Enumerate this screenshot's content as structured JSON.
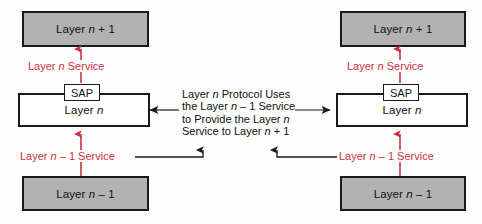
{
  "diagram": {
    "colors": {
      "box_fill_shaded": "#b2b2b2",
      "box_fill_hollow": "#ffffff",
      "box_border": "#1a1a1a",
      "service_label": "#c9333f",
      "protocol_line": "#1a1a1a",
      "background": "#fdfdfd"
    },
    "left_stack": {
      "upper_layer_box": "Layer n + 1",
      "middle_layer_box": "Layer n",
      "lower_layer_box": "Layer n – 1",
      "sap_box": "SAP",
      "upper_service_label": "Layer n Service",
      "lower_service_label": "Layer n – 1 Service"
    },
    "right_stack": {
      "upper_layer_box": "Layer n + 1",
      "middle_layer_box": "Layer n",
      "lower_layer_box": "Layer n – 1",
      "sap_box": "SAP",
      "upper_service_label": "Layer n Service",
      "lower_service_label": "Layer n – 1 Service"
    },
    "center_note": {
      "line1": "Layer n Protocol Uses",
      "line2": "the Layer n – 1 Service",
      "line3": "to Provide the Layer n",
      "line4": "Service to Layer n + 1"
    }
  }
}
